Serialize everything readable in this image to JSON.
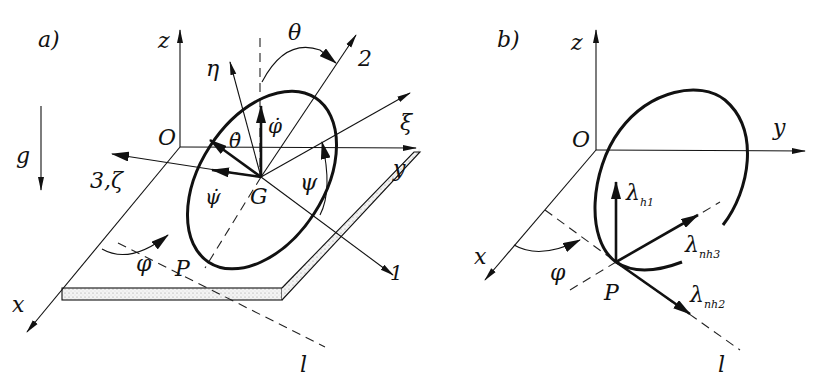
{
  "figure": {
    "panels": [
      {
        "id": "a",
        "label": "a)",
        "axes": {
          "x": "x",
          "y": "y",
          "z": "z",
          "origin": "O"
        },
        "gravity": "g",
        "points": {
          "center": "G",
          "contact": "P"
        },
        "body_axes": {
          "axis1": "1",
          "axis2": "2",
          "axis3": "3,ζ",
          "xi": "ξ",
          "eta": "η"
        },
        "angles": {
          "theta": "θ",
          "psi": "ψ",
          "phi": "φ"
        },
        "rates": {
          "phi_dot": "φ̇",
          "theta_dot": "θ̇",
          "psi_dot": "ψ̇"
        },
        "line": "l"
      },
      {
        "id": "b",
        "label": "b)",
        "axes": {
          "x": "x",
          "y": "y",
          "z": "z",
          "origin": "O"
        },
        "points": {
          "contact": "P"
        },
        "angles": {
          "phi": "φ"
        },
        "forces": {
          "lambda_h1": {
            "base": "λ",
            "sub": "h1"
          },
          "lambda_nh2": {
            "base": "λ",
            "sub": "nh2"
          },
          "lambda_nh3": {
            "base": "λ",
            "sub": "nh3"
          }
        },
        "line": "l"
      }
    ]
  }
}
